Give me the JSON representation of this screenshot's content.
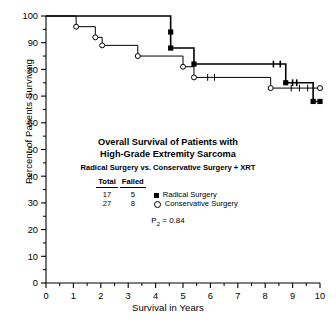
{
  "figure": {
    "title_line1": "Overall Survival of Patients with",
    "title_line2": "High-Grade Extremity Sarcoma",
    "subtitle": "Radical Surgery vs. Conservative Surgery + XRT",
    "xlabel": "Survival in Years",
    "ylabel": "Percent of Patients Surviving",
    "pvalue_label": "P",
    "pvalue_sub": "2",
    "pvalue_eq": "=",
    "pvalue": "0.84"
  },
  "table": {
    "headers": [
      "Total",
      "Failed"
    ],
    "rows": [
      {
        "total": "17",
        "failed": "5",
        "legend": "Radical Surgery",
        "marker": "filled-square"
      },
      {
        "total": "27",
        "failed": "8",
        "legend": "Conservative Surgery",
        "marker": "open-circle"
      }
    ]
  },
  "chart_data": {
    "type": "line",
    "title": "Overall Survival of Patients with High-Grade Extremity Sarcoma",
    "subtitle": "Radical Surgery vs. Conservative Surgery + XRT",
    "xlabel": "Survival in Years",
    "ylabel": "Percent of Patients Surviving",
    "xlim": [
      0,
      10
    ],
    "ylim": [
      0,
      100
    ],
    "xticks": [
      0,
      1,
      2,
      3,
      4,
      5,
      6,
      7,
      8,
      9,
      10
    ],
    "xticklabels": [
      "0",
      "1",
      "2",
      "3",
      "4",
      "5",
      "6",
      "7",
      "8",
      "9",
      "10"
    ],
    "yticks": [
      0,
      10,
      20,
      30,
      40,
      50,
      60,
      70,
      80,
      90,
      100
    ],
    "yticklabels": [
      "0",
      "10",
      "20",
      "30",
      "40",
      "50",
      "60",
      "70",
      "80",
      "90",
      "100"
    ],
    "minor_tick_step_x": 0.5,
    "minor_tick_step_y": 5,
    "grid": false,
    "legend_position": "center",
    "annotation_pvalue": "P2 = 0.84",
    "series": [
      {
        "name": "Radical Surgery",
        "marker": "filled-square",
        "total": 17,
        "failed": 5,
        "steps": [
          {
            "x": 0.0,
            "y": 100
          },
          {
            "x": 4.55,
            "y": 100
          },
          {
            "x": 4.55,
            "y": 94
          },
          {
            "x": 4.55,
            "y": 88
          },
          {
            "x": 5.4,
            "y": 88
          },
          {
            "x": 5.4,
            "y": 82
          },
          {
            "x": 8.75,
            "y": 82
          },
          {
            "x": 8.75,
            "y": 75
          },
          {
            "x": 9.75,
            "y": 75
          },
          {
            "x": 9.75,
            "y": 68
          },
          {
            "x": 10.0,
            "y": 68
          }
        ],
        "event_markers": [
          {
            "x": 4.55,
            "y": 94
          },
          {
            "x": 4.55,
            "y": 88
          },
          {
            "x": 5.4,
            "y": 82
          },
          {
            "x": 8.75,
            "y": 75
          },
          {
            "x": 9.75,
            "y": 68
          },
          {
            "x": 10.0,
            "y": 68
          }
        ],
        "censor_ticks": [
          {
            "x": 8.3,
            "y": 82
          },
          {
            "x": 8.55,
            "y": 82
          },
          {
            "x": 9.0,
            "y": 75
          },
          {
            "x": 9.15,
            "y": 75
          }
        ]
      },
      {
        "name": "Conservative Surgery",
        "marker": "open-circle",
        "total": 27,
        "failed": 8,
        "steps": [
          {
            "x": 0.0,
            "y": 100
          },
          {
            "x": 1.1,
            "y": 100
          },
          {
            "x": 1.1,
            "y": 96
          },
          {
            "x": 1.8,
            "y": 96
          },
          {
            "x": 1.8,
            "y": 92
          },
          {
            "x": 2.05,
            "y": 92
          },
          {
            "x": 2.05,
            "y": 89
          },
          {
            "x": 3.35,
            "y": 89
          },
          {
            "x": 3.35,
            "y": 85
          },
          {
            "x": 5.0,
            "y": 85
          },
          {
            "x": 5.0,
            "y": 81
          },
          {
            "x": 5.4,
            "y": 81
          },
          {
            "x": 5.4,
            "y": 77
          },
          {
            "x": 8.2,
            "y": 77
          },
          {
            "x": 8.2,
            "y": 73
          },
          {
            "x": 10.0,
            "y": 73
          }
        ],
        "event_markers": [
          {
            "x": 1.1,
            "y": 96
          },
          {
            "x": 1.8,
            "y": 92
          },
          {
            "x": 2.05,
            "y": 89
          },
          {
            "x": 3.35,
            "y": 85
          },
          {
            "x": 5.0,
            "y": 81
          },
          {
            "x": 5.4,
            "y": 77
          },
          {
            "x": 8.2,
            "y": 73
          },
          {
            "x": 10.0,
            "y": 73
          }
        ],
        "censor_ticks": [
          {
            "x": 5.9,
            "y": 77
          },
          {
            "x": 6.15,
            "y": 77
          },
          {
            "x": 8.95,
            "y": 73
          },
          {
            "x": 9.25,
            "y": 73
          },
          {
            "x": 9.55,
            "y": 73
          }
        ]
      }
    ]
  }
}
